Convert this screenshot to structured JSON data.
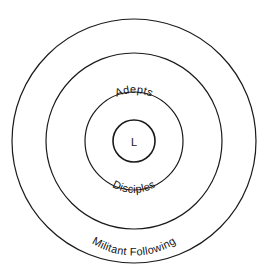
{
  "diagram": {
    "type": "concentric-rings",
    "background_color": "#ffffff",
    "stroke_color": "#1a1a1a",
    "text_color": "#141414",
    "center": {
      "x": 134,
      "y": 141
    },
    "center_label": "L",
    "rings": [
      {
        "id": "core",
        "label": "L",
        "radius": 21,
        "stroke_width": 1.5,
        "level": 1
      },
      {
        "id": "adepts",
        "label": "Adepts",
        "radius": 49,
        "stroke_width": 1.2,
        "level": 2
      },
      {
        "id": "disciples",
        "label": "Disciples",
        "radius": 49,
        "stroke_width": 1.2,
        "level": 2
      },
      {
        "id": "militant-following",
        "label": "Militant Following",
        "radius": 88,
        "stroke_width": 1.2,
        "level": 3
      },
      {
        "id": "passive-sympathizers",
        "label": "Passive Sympathizers",
        "radius": 122,
        "stroke_width": 1.2,
        "level": 4
      }
    ],
    "labels": {
      "core": "L",
      "adepts": "Adepts",
      "disciples": "Disciples",
      "militant_following": "Militant Following",
      "passive_sympathizers": "Passive Sympathizers"
    },
    "font_sizes": {
      "core": 11,
      "adepts": 11,
      "disciples": 11,
      "militant_following": 11,
      "passive_sympathizers": 11
    }
  }
}
